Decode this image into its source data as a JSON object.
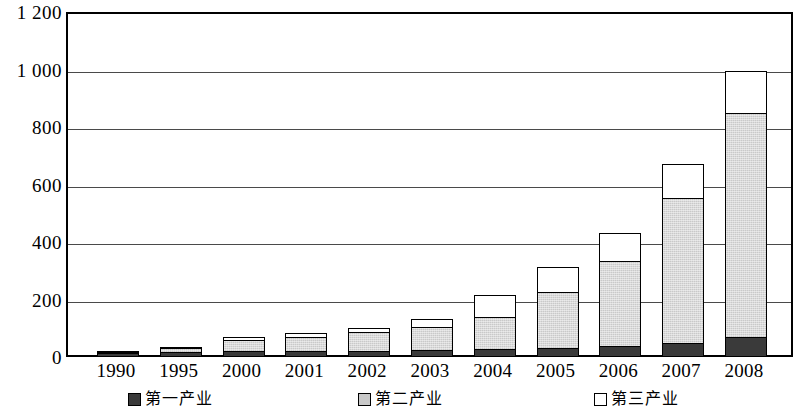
{
  "chart_data": {
    "type": "bar",
    "subtype": "stacked",
    "title": "",
    "xlabel": "",
    "ylabel": "",
    "ylim": [
      0,
      1200
    ],
    "ytick_step": 200,
    "grid": true,
    "legend_position": "bottom",
    "categories": [
      "1990",
      "1995",
      "2000",
      "2001",
      "2002",
      "2003",
      "2004",
      "2005",
      "2006",
      "2007",
      "2008"
    ],
    "ytick_labels": [
      "0",
      "200",
      "400",
      "600",
      "800",
      "1 000",
      "1 200"
    ],
    "ytick_values": [
      0,
      200,
      400,
      600,
      800,
      1000,
      1200
    ],
    "series": [
      {
        "name": "第一产业",
        "color": "#3a3a3a",
        "values": [
          12,
          16,
          18,
          18,
          20,
          22,
          26,
          30,
          38,
          48,
          68
        ]
      },
      {
        "name": "第二产业",
        "color": "#c9c9c9",
        "values": [
          10,
          20,
          44,
          56,
          72,
          88,
          118,
          202,
          300,
          508,
          786
        ]
      },
      {
        "name": "第三产业",
        "color": "#ffffff",
        "values": [
          2,
          4,
          18,
          18,
          20,
          32,
          80,
          90,
          104,
          126,
          152
        ]
      }
    ],
    "totals": [
      24,
      40,
      80,
      92,
      112,
      142,
      224,
      322,
      442,
      682,
      1006
    ]
  },
  "legend": {
    "items": [
      {
        "label": "第一产业",
        "swatch": "s1"
      },
      {
        "label": "第二产业",
        "swatch": "s2"
      },
      {
        "label": "第三产业",
        "swatch": "s3"
      }
    ]
  }
}
